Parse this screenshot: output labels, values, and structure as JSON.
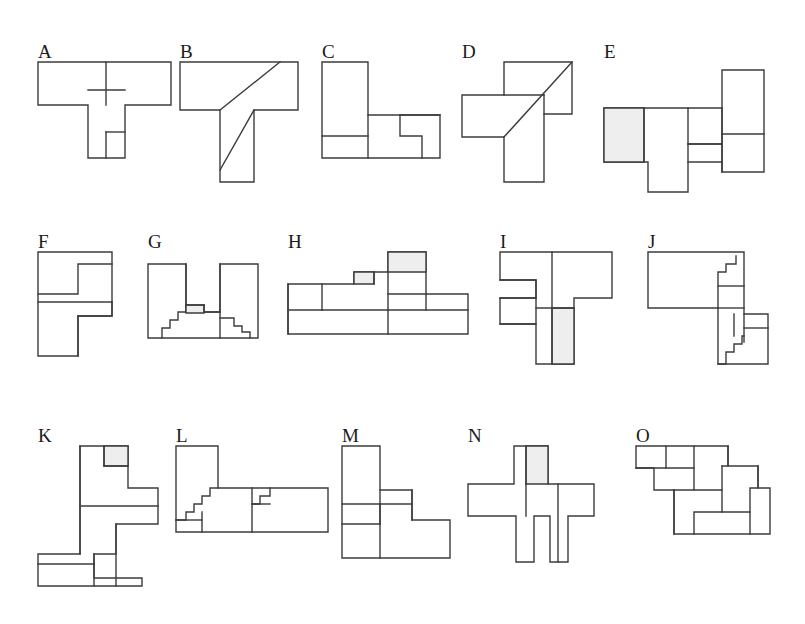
{
  "page": {
    "background_color": "#ffffff",
    "line_color": "#3c3c3c",
    "shade_color": "#eeeeee",
    "width": 805,
    "height": 624,
    "figure_count": 15,
    "rows": 3,
    "columns": 5
  },
  "figures": [
    {
      "id": "A",
      "label": "A",
      "row": 1,
      "column": 1,
      "description": "T-shaped polyomino: wide horizontal bar on top with a vertical stem below, stem subdivided and containing a small square at lower left",
      "piece_count": 4,
      "has_diagonal": false,
      "shaded_cells": 0
    },
    {
      "id": "B",
      "label": "B",
      "row": 1,
      "column": 2,
      "description": "T-shaped polyomino with two parallel diagonal cuts, one through the horizontal bar and one through the vertical stem",
      "piece_count": 3,
      "has_diagonal": true,
      "shaded_cells": 0
    },
    {
      "id": "C",
      "label": "C",
      "row": 1,
      "column": 3,
      "description": "L-shaped polyomino with a tall column at left and a wide base, containing a stepped notch and a small square at lower left",
      "piece_count": 4,
      "has_diagonal": false,
      "shaded_cells": 0
    },
    {
      "id": "D",
      "label": "D",
      "row": 1,
      "column": 4,
      "description": "Pinwheel cross of three rectangles crossed by one long diagonal from lower left to upper right",
      "piece_count": 3,
      "has_diagonal": true,
      "shaded_cells": 0
    },
    {
      "id": "E",
      "label": "E",
      "row": 1,
      "column": 5,
      "description": "Horizontal band of rectangles with a tall block rising at the right and a block hanging below centre; leftmost square is shaded",
      "piece_count": 5,
      "has_diagonal": false,
      "shaded_cells": 1
    },
    {
      "id": "F",
      "label": "F",
      "row": 2,
      "column": 1,
      "description": "Tall rectangle split into an upper S-shaped piece and a lower Z-shaped piece",
      "piece_count": 3,
      "has_diagonal": false,
      "shaded_cells": 0
    },
    {
      "id": "G",
      "label": "G",
      "row": 2,
      "column": 2,
      "description": "Two tall columns flanking a central staircase mound with fine stepped edges",
      "piece_count": 5,
      "has_diagonal": false,
      "shaded_cells": 0
    },
    {
      "id": "H",
      "label": "H",
      "row": 2,
      "column": 3,
      "description": "Long horizontal assembly with a raised block at the right of centre and a small notch at the left; two cells shaded",
      "piece_count": 5,
      "has_diagonal": false,
      "shaded_cells": 2
    },
    {
      "id": "I",
      "label": "I",
      "row": 2,
      "column": 4,
      "description": "Interlocking Z and T shapes forming a squat cross; the lower centre column is shaded",
      "piece_count": 4,
      "has_diagonal": false,
      "shaded_cells": 1
    },
    {
      "id": "J",
      "label": "J",
      "row": 2,
      "column": 5,
      "description": "L-shaped block with a tall central column bearing fine staircase steps on both upper and lower edges",
      "piece_count": 5,
      "has_diagonal": false,
      "shaded_cells": 0
    },
    {
      "id": "K",
      "label": "K",
      "row": 3,
      "column": 1,
      "description": "Tall zigzag stack of rectangles descending from upper right to lower left; small square at top right is shaded",
      "piece_count": 5,
      "has_diagonal": false,
      "shaded_cells": 1
    },
    {
      "id": "L",
      "label": "L",
      "row": 3,
      "column": 2,
      "description": "Wide low arrangement with a tall column at far left and two staircase notches along the middle",
      "piece_count": 5,
      "has_diagonal": false,
      "shaded_cells": 0
    },
    {
      "id": "M",
      "label": "M",
      "row": 3,
      "column": 3,
      "description": "Stepped block with a tall left column, a small square at centre right and a wide base",
      "piece_count": 5,
      "has_diagonal": false,
      "shaded_cells": 0
    },
    {
      "id": "N",
      "label": "N",
      "row": 3,
      "column": 4,
      "description": "Cross shape with a shaded column rising at the top left of centre and two narrow legs hanging below",
      "piece_count": 4,
      "has_diagonal": false,
      "shaded_cells": 1
    },
    {
      "id": "O",
      "label": "O",
      "row": 3,
      "column": 5,
      "description": "Descending staircase of four interlocking blocks stepping down from upper left to lower right",
      "piece_count": 6,
      "has_diagonal": false,
      "shaded_cells": 0
    }
  ]
}
